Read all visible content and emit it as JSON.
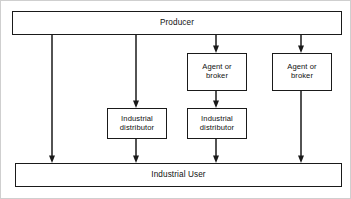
{
  "diagram": {
    "background_color": "#ffffff",
    "line_color": "#1a1a1a",
    "text_color": "#111111",
    "nodes": [
      {
        "id": "producer",
        "label": "Producer",
        "role": "source-band",
        "x": 11,
        "y": 10,
        "w": 330,
        "h": 24,
        "font": "band"
      },
      {
        "id": "agent-broker-1",
        "label": "Agent or\nbroker",
        "role": "intermediary",
        "x": 186,
        "y": 52,
        "w": 60,
        "h": 38,
        "font": "small"
      },
      {
        "id": "agent-broker-2",
        "label": "Agent or\nbroker",
        "role": "intermediary",
        "x": 271,
        "y": 52,
        "w": 60,
        "h": 38,
        "font": "small"
      },
      {
        "id": "industrial-distributor-1",
        "label": "Industrial\ndistributor",
        "role": "intermediary",
        "x": 106,
        "y": 107,
        "w": 60,
        "h": 31,
        "font": "small"
      },
      {
        "id": "industrial-distributor-2",
        "label": "Industrial\ndistributor",
        "role": "intermediary",
        "x": 186,
        "y": 107,
        "w": 60,
        "h": 31,
        "font": "small"
      },
      {
        "id": "industrial-user",
        "label": "Industrial User",
        "role": "destination-band",
        "x": 14,
        "y": 162,
        "w": 327,
        "h": 24,
        "font": "band"
      }
    ],
    "arrows": [
      {
        "id": "producer-to-user-direct",
        "x": 51,
        "y1": 34,
        "y2": 162
      },
      {
        "id": "producer-to-distributor-1",
        "x": 135,
        "y1": 34,
        "y2": 107
      },
      {
        "id": "distributor-1-to-user",
        "x": 135,
        "y1": 138,
        "y2": 162
      },
      {
        "id": "producer-to-agent-1",
        "x": 215,
        "y1": 34,
        "y2": 52
      },
      {
        "id": "agent-1-to-distributor-2",
        "x": 215,
        "y1": 90,
        "y2": 107
      },
      {
        "id": "distributor-2-to-user",
        "x": 215,
        "y1": 138,
        "y2": 162
      },
      {
        "id": "producer-to-agent-2",
        "x": 300,
        "y1": 34,
        "y2": 52
      },
      {
        "id": "agent-2-to-user",
        "x": 300,
        "y1": 90,
        "y2": 162
      }
    ]
  }
}
